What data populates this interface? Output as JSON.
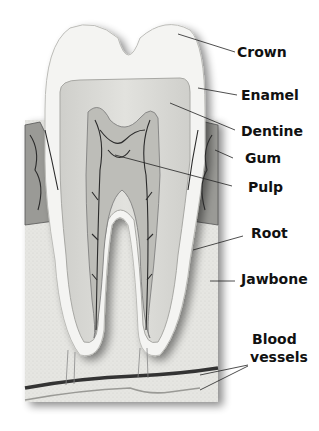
{
  "diagram": {
    "labels": [
      {
        "id": "crown",
        "text": "Crown"
      },
      {
        "id": "enamel",
        "text": "Enamel"
      },
      {
        "id": "dentine",
        "text": "Dentine"
      },
      {
        "id": "gum",
        "text": "Gum"
      },
      {
        "id": "pulp",
        "text": "Pulp"
      },
      {
        "id": "root",
        "text": "Root"
      },
      {
        "id": "jawbone",
        "text": "Jawbone"
      },
      {
        "id": "blood_vessels_1",
        "text": "Blood"
      },
      {
        "id": "blood_vessels_2",
        "text": "vessels"
      }
    ]
  }
}
